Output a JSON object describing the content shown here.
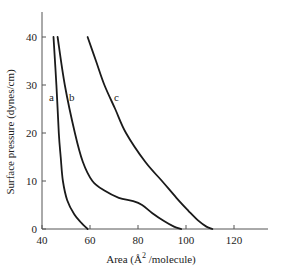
{
  "chart_data": {
    "type": "line",
    "title": "",
    "xlabel": "Area (Å² /molecule)",
    "ylabel": "Surface pressure (dynes/cm)",
    "xlim": [
      40,
      135
    ],
    "ylim": [
      0,
      45
    ],
    "xticks": [
      40,
      60,
      80,
      100,
      120
    ],
    "yticks": [
      0,
      10,
      20,
      30,
      40
    ],
    "grid": false,
    "legend": "none (curves labeled inline a, b, c)",
    "series": [
      {
        "name": "a",
        "x": [
          44.8,
          46.0,
          47.0,
          47.8,
          48.7,
          50.5,
          53.5,
          56.5,
          59.0
        ],
        "y": [
          40,
          30,
          20,
          15,
          10,
          6,
          3,
          1.2,
          0
        ]
      },
      {
        "name": "b",
        "x": [
          46.5,
          49.5,
          53.7,
          57.0,
          61.0,
          66.0,
          72.0,
          78.0,
          81.7,
          86.0,
          91.0,
          95.0,
          98.0
        ],
        "y": [
          40,
          30,
          20,
          14,
          10,
          8,
          6.5,
          5.8,
          5.0,
          3.3,
          1.6,
          0.5,
          0
        ]
      },
      {
        "name": "c",
        "x": [
          59.0,
          62.5,
          66.0,
          70.5,
          75.0,
          83.0,
          90.0,
          96.0,
          101.0,
          105.0,
          108.5,
          111.0
        ],
        "y": [
          40,
          35,
          30,
          25,
          20,
          14,
          10,
          6.5,
          3.8,
          1.8,
          0.5,
          0
        ]
      }
    ],
    "annotations": [
      {
        "text": "a",
        "x": 44.0,
        "y": 27
      },
      {
        "text": "b",
        "x": 49.5,
        "y": 27
      },
      {
        "text": "c",
        "x": 71.5,
        "y": 27
      }
    ]
  },
  "axes": {
    "x_tick_labels": [
      "40",
      "60",
      "80",
      "100",
      "120"
    ],
    "y_tick_labels": [
      "0",
      "10",
      "20",
      "30",
      "40"
    ],
    "x_title": "Area (Å",
    "x_title_sup": "2",
    "x_title_rest": " /molecule)",
    "y_title": "Surface pressure (dynes/cm)"
  },
  "labels": {
    "a": "a",
    "b": "b",
    "c": "c"
  }
}
